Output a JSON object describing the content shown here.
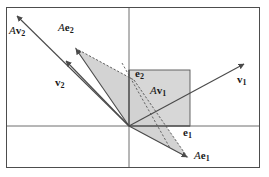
{
  "figure": {
    "kind": "linear-transformation-diagram",
    "width": 269,
    "height": 177,
    "background_color": "#ffffff",
    "frame": {
      "x": 6,
      "y": 7,
      "width": 254,
      "height": 161,
      "border_color": "#4d4d4d"
    },
    "axes": {
      "x_axis_y": 126,
      "y_axis_x": 129,
      "color": "#6b6b6b"
    },
    "origin": {
      "x": 129,
      "y": 126
    },
    "shading": {
      "fill": "#d4d4d4",
      "opacity": 0.85,
      "outline": "#555555"
    },
    "unit_square": {
      "left": 129,
      "top": 70,
      "right": 190,
      "bottom": 126,
      "fill": "#d4d4d4",
      "stroke": "#555555"
    },
    "vectors": [
      {
        "name": "Av2",
        "label": "Av₂",
        "tip": {
          "x": 16,
          "y": 15
        },
        "style": "solid-arrow"
      },
      {
        "name": "Ae2",
        "label": "Ae₂",
        "tip": {
          "x": 75,
          "y": 48
        },
        "style": "solid-arrow"
      },
      {
        "name": "v2",
        "label": "v₂",
        "tip": {
          "x": 65,
          "y": 60
        },
        "style": "solid-arrow"
      },
      {
        "name": "v1",
        "label": "v₁",
        "tip": {
          "x": 245,
          "y": 63
        },
        "style": "solid-arrow"
      },
      {
        "name": "e2",
        "label": "e₂",
        "tip": {
          "x": 129,
          "y": 70
        },
        "style": "solid"
      },
      {
        "name": "e1",
        "label": "e₁",
        "tip": {
          "x": 190,
          "y": 126
        },
        "style": "solid"
      },
      {
        "name": "Ae1",
        "label": "Ae₁",
        "tip": {
          "x": 188,
          "y": 158
        },
        "style": "solid-arrow"
      },
      {
        "name": "Av1",
        "label": "Av₁",
        "tip": {
          "x": 190,
          "y": 104
        },
        "style": "region-label"
      }
    ],
    "labels": {
      "Av2": {
        "prefix": "A",
        "base": "v",
        "sub": "2",
        "x": 10,
        "y": 28
      },
      "Ae2": {
        "prefix": "A",
        "base": "e",
        "sub": "2",
        "x": 60,
        "y": 25
      },
      "v2": {
        "prefix": "",
        "base": "v",
        "sub": "2",
        "x": 56,
        "y": 80
      },
      "v1": {
        "prefix": "",
        "base": "v",
        "sub": "1",
        "x": 238,
        "y": 77
      },
      "e2": {
        "prefix": "",
        "base": "e",
        "sub": "2",
        "x": 135,
        "y": 70
      },
      "e1": {
        "prefix": "",
        "base": "e",
        "sub": "1",
        "x": 184,
        "y": 128
      },
      "Ae1": {
        "prefix": "A",
        "base": "e",
        "sub": "1",
        "x": 195,
        "y": 152
      },
      "Av1": {
        "prefix": "A",
        "base": "v",
        "sub": "1",
        "x": 151,
        "y": 88
      }
    }
  }
}
